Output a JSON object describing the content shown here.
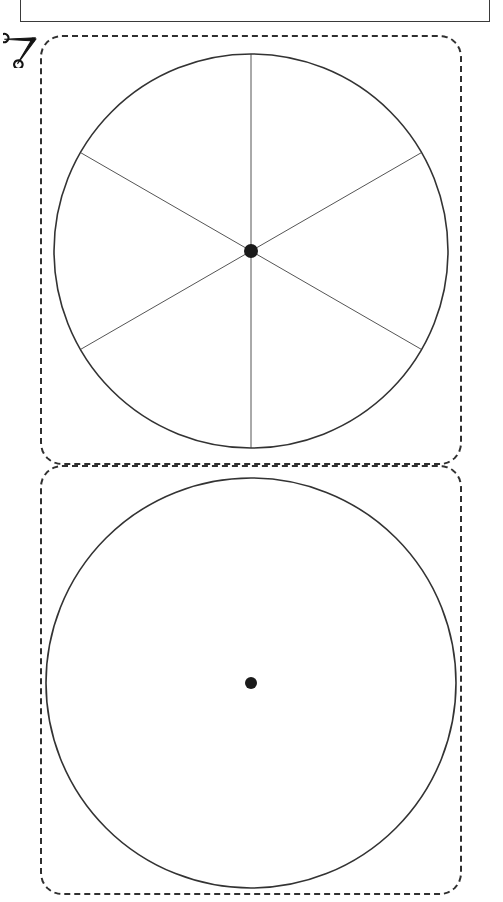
{
  "document": {
    "title": "Fraction Circles Cut-Out Worksheet",
    "page_background": "#ffffff",
    "width": 503,
    "height": 902
  },
  "header": {
    "rule_color": "#3a3a3a",
    "clipped_glyph_color": "#c9c9c9",
    "note": "bottom edge of a header box cropped at the top of the page"
  },
  "cut_marker": {
    "icon": "scissors-icon",
    "label": "cut along dashed line",
    "color": "#1a1a1a"
  },
  "panels": [
    {
      "id": "panel-top",
      "name": "cut-panel-divided-circle",
      "border_style": "dashed",
      "border_color": "#2f2f2f",
      "corner_radius_px": 22
    },
    {
      "id": "panel-bottom",
      "name": "cut-panel-whole-circle",
      "border_style": "dashed",
      "border_color": "#2f2f2f",
      "corner_radius_px": 22
    }
  ],
  "figures": {
    "type": "geometry-diagram",
    "stroke_color": "#333333",
    "center_dot_color": "#1a1a1a",
    "items": [
      {
        "name": "divided-circle",
        "shape": "circle",
        "center": [
          251,
          251
        ],
        "radius": 197,
        "center_dot_radius": 7,
        "sectors": 6,
        "sector_angle_degrees": 60,
        "fraction_per_sector": "1/6",
        "radii_angles_degrees": [
          90,
          150,
          210,
          270,
          330,
          30
        ],
        "radius_line_color": "#555555",
        "outline_width": 1.6,
        "filled": false
      },
      {
        "name": "whole-circle",
        "shape": "circle",
        "center": [
          251,
          683
        ],
        "radius": 205,
        "center_dot_radius": 6,
        "sectors": 1,
        "sector_angle_degrees": 360,
        "fraction_per_sector": "1/1",
        "radii_angles_degrees": [],
        "radius_line_color": "#555555",
        "outline_width": 1.6,
        "filled": false
      }
    ]
  }
}
